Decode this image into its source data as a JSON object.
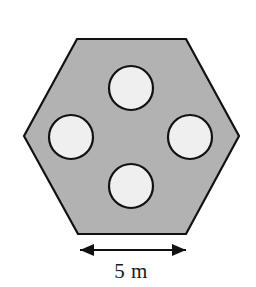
{
  "figure": {
    "background_color": "#ffffff",
    "outline_color": "#111111",
    "outline_width": 2.2,
    "shape": {
      "name": "hexagon",
      "orientation": "flat-top",
      "fill_color": "#b2b2b2",
      "vertices": [
        [
          77,
          39
        ],
        [
          186,
          39
        ],
        [
          239,
          136
        ],
        [
          186,
          234
        ],
        [
          78,
          234
        ],
        [
          24,
          136
        ]
      ]
    },
    "holes": [
      {
        "name": "hole-top",
        "cx": 131,
        "cy": 88,
        "r": 22,
        "fill_color": "#efefef"
      },
      {
        "name": "hole-left",
        "cx": 71,
        "cy": 137,
        "r": 22,
        "fill_color": "#efefef"
      },
      {
        "name": "hole-right",
        "cx": 190,
        "cy": 137,
        "r": 22,
        "fill_color": "#efefef"
      },
      {
        "name": "hole-bottom",
        "cx": 131,
        "cy": 186,
        "r": 22,
        "fill_color": "#efefef"
      }
    ],
    "dimension": {
      "name": "bottom-width-dimension",
      "label": "5 m",
      "value": 5,
      "unit": "m",
      "measures": "bottom-edge-length",
      "line_y": 250,
      "x_start": 80,
      "x_end": 186,
      "label_x": 131,
      "label_y": 278,
      "arrow_style": "double-headed",
      "color": "#111111"
    }
  }
}
